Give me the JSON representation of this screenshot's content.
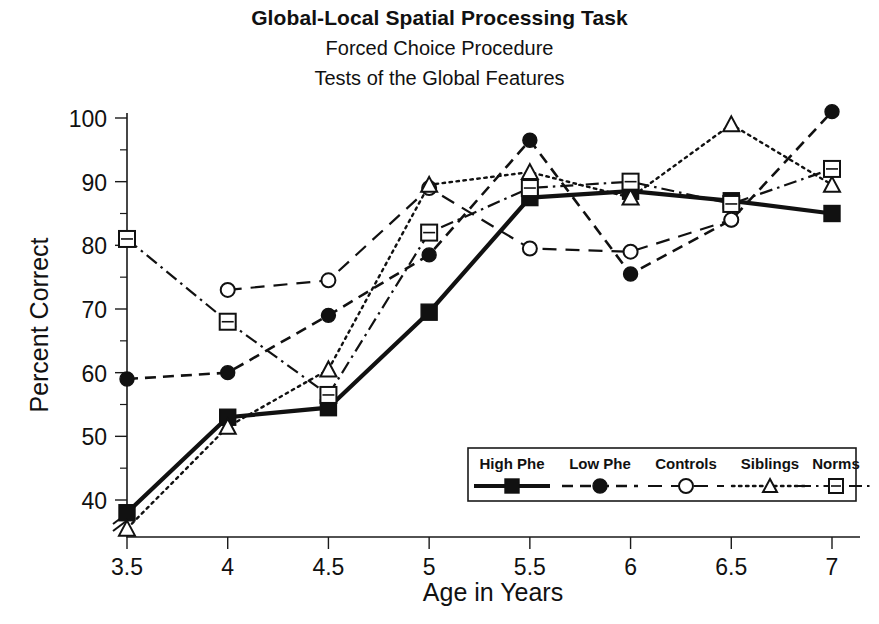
{
  "title": {
    "line1": "Global-Local Spatial Processing Task",
    "line2": "Forced Choice Procedure",
    "line3": "Tests of the Global Features"
  },
  "axes": {
    "xlabel": "Age in Years",
    "ylabel": "Percent Correct",
    "x_ticklabels": [
      "3.5",
      "4",
      "4.5",
      "5",
      "5.5",
      "6",
      "6.5",
      "7"
    ],
    "y_ticklabels": [
      "40",
      "50",
      "60",
      "70",
      "80",
      "90",
      "100"
    ],
    "y_axis_break": true
  },
  "legend": {
    "entries": [
      {
        "label": "High Phe",
        "marker": "filled-square",
        "line": "solid"
      },
      {
        "label": "Low Phe",
        "marker": "filled-circle",
        "line": "dashed"
      },
      {
        "label": "Controls",
        "marker": "open-circle",
        "line": "long-dashed"
      },
      {
        "label": "Siblings",
        "marker": "open-triangle",
        "line": "dotted"
      },
      {
        "label": "Norms",
        "marker": "circled-plus",
        "line": "dash-dot"
      }
    ]
  },
  "chart_data": {
    "type": "line",
    "xlabel": "Age in Years",
    "ylabel": "Percent Correct",
    "x": [
      3.5,
      4,
      4.5,
      5,
      5.5,
      6,
      6.5,
      7
    ],
    "xlim": [
      3.5,
      7
    ],
    "ylim": [
      35,
      102
    ],
    "grid": false,
    "legend_position": "inside-lower-right",
    "series": [
      {
        "name": "High Phe",
        "marker": "filled-square",
        "values": [
          38,
          53,
          54.5,
          69.5,
          87.5,
          88.5,
          87,
          85
        ]
      },
      {
        "name": "Low Phe",
        "marker": "filled-circle",
        "values": [
          59,
          60,
          69,
          78.5,
          96.5,
          75.5,
          84,
          101
        ]
      },
      {
        "name": "Controls",
        "marker": "open-circle",
        "values": [
          null,
          73,
          74.5,
          89,
          79.5,
          79,
          84,
          null
        ]
      },
      {
        "name": "Siblings",
        "marker": "open-triangle",
        "values": [
          35.5,
          51.5,
          60.5,
          89.5,
          91.5,
          87.5,
          99,
          89.5
        ]
      },
      {
        "name": "Norms",
        "marker": "circled-plus",
        "values": [
          81,
          68,
          56.5,
          82,
          89,
          90,
          86.5,
          92
        ]
      }
    ]
  }
}
